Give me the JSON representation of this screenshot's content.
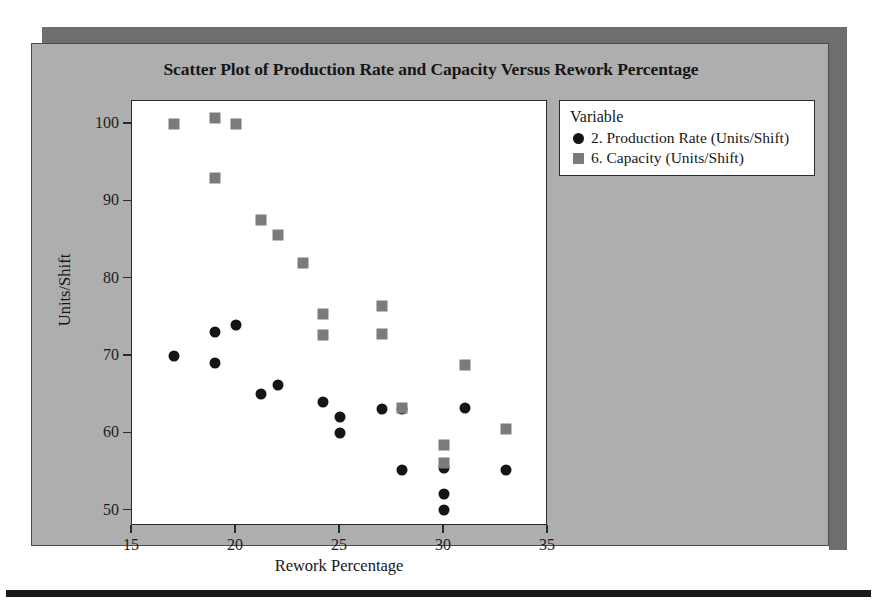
{
  "figure": {
    "background_color": "#aeaeae",
    "band_color": "#6e6e6e",
    "plot_background": "#ffffff"
  },
  "chart_data": {
    "type": "scatter",
    "title": "Scatter Plot of Production Rate and Capacity Versus Rework Percentage",
    "xlabel": "Rework Percentage",
    "ylabel": "Units/Shift",
    "xlim": [
      15,
      35
    ],
    "ylim": [
      48,
      103
    ],
    "xticks": [
      15,
      20,
      25,
      30,
      35
    ],
    "yticks": [
      50,
      60,
      70,
      80,
      90,
      100
    ],
    "grid": false,
    "legend_title": "Variable",
    "legend_position": "right-top",
    "series": [
      {
        "name": "2. Production Rate (Units/Shift)",
        "marker": "circle",
        "color": "#151515",
        "points": [
          [
            17.0,
            70.0
          ],
          [
            19.0,
            73.1
          ],
          [
            19.0,
            69.1
          ],
          [
            20.0,
            74.0
          ],
          [
            21.2,
            65.1
          ],
          [
            22.0,
            66.2
          ],
          [
            24.2,
            64.1
          ],
          [
            25.0,
            62.1
          ],
          [
            25.0,
            60.1
          ],
          [
            27.0,
            63.2
          ],
          [
            28.0,
            63.2
          ],
          [
            28.0,
            55.2
          ],
          [
            30.0,
            55.5
          ],
          [
            30.0,
            52.1
          ],
          [
            30.0,
            50.1
          ],
          [
            31.0,
            63.3
          ],
          [
            33.0,
            55.2
          ]
        ]
      },
      {
        "name": "6. Capacity (Units/Shift)",
        "marker": "square",
        "color": "#7b7b7b",
        "points": [
          [
            17.0,
            100.0
          ],
          [
            19.0,
            100.8
          ],
          [
            20.0,
            100.0
          ],
          [
            19.0,
            93.0
          ],
          [
            21.2,
            87.6
          ],
          [
            22.0,
            85.7
          ],
          [
            23.2,
            82.0
          ],
          [
            24.2,
            75.5
          ],
          [
            24.2,
            72.7
          ],
          [
            27.0,
            76.5
          ],
          [
            27.0,
            72.9
          ],
          [
            28.0,
            63.3
          ],
          [
            30.0,
            58.5
          ],
          [
            30.0,
            56.1
          ],
          [
            31.0,
            68.8
          ],
          [
            33.0,
            60.5
          ]
        ]
      }
    ]
  }
}
